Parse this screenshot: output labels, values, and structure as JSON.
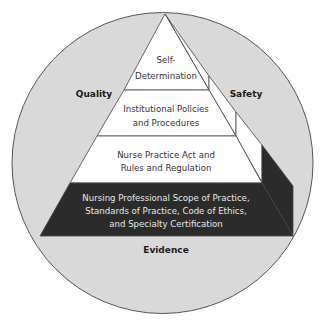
{
  "diagram": {
    "outer_labels": {
      "left": "Quality",
      "right": "Safety",
      "bottom": "Evidence"
    },
    "pyramid_levels": [
      {
        "level": 1,
        "lines": [
          "Self-",
          "Determination"
        ]
      },
      {
        "level": 2,
        "lines": [
          "Institutional Policies",
          "and Procedures"
        ]
      },
      {
        "level": 3,
        "lines": [
          "Nurse Practice Act and",
          "Rules and Regulation"
        ]
      },
      {
        "level": 4,
        "lines": [
          "Nursing Professional Scope of Practice,",
          "Standards of Practice, Code of Ethics,",
          "and Specialty Certification"
        ]
      }
    ],
    "colors": {
      "circle_fill": "#d9d9d9",
      "level_fill": "#ffffff",
      "base_fill": "#2b2b2b",
      "outline": "#444444"
    }
  }
}
